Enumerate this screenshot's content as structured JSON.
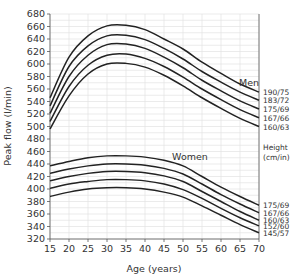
{
  "chart_data": {
    "type": "line",
    "title": "",
    "xlabel": "Age (years)",
    "ylabel": "Peak flow (l/min)",
    "xlim": [
      15,
      70
    ],
    "ylim": [
      320,
      680
    ],
    "x_ticks": [
      15,
      20,
      25,
      30,
      35,
      40,
      45,
      50,
      55,
      60,
      65,
      70
    ],
    "y_ticks": [
      320,
      340,
      360,
      380,
      400,
      420,
      440,
      460,
      480,
      500,
      520,
      540,
      560,
      580,
      600,
      620,
      640,
      660,
      680
    ],
    "grid": true,
    "x": [
      15,
      20,
      25,
      30,
      35,
      40,
      45,
      50,
      55,
      60,
      65,
      70
    ],
    "groups": [
      {
        "name": "Men",
        "series": [
          {
            "name": "190/75",
            "values": [
              546,
              611,
              645,
              661,
              662,
              655,
              640,
              624,
              603,
              585,
              568,
              555
            ]
          },
          {
            "name": "183/72",
            "values": [
              533,
              596,
              629,
              645,
              646,
              639,
              625,
              608,
              588,
              571,
              555,
              542
            ]
          },
          {
            "name": "175/69",
            "values": [
              521,
              580,
              614,
              631,
              632,
              625,
              611,
              594,
              574,
              557,
              541,
              528
            ]
          },
          {
            "name": "167/66",
            "values": [
              508,
              564,
              598,
              614,
              616,
              609,
              596,
              579,
              560,
              543,
              527,
              514
            ]
          },
          {
            "name": "160/63",
            "values": [
              496,
              549,
              584,
              600,
              601,
              595,
              582,
              565,
              546,
              529,
              513,
              500
            ]
          }
        ]
      },
      {
        "name": "Women",
        "series": [
          {
            "name": "175/69",
            "values": [
              437,
              444,
              450,
              453,
              453,
              451,
              446,
              437,
              420,
              403,
              388,
              374
            ]
          },
          {
            "name": "167/66",
            "values": [
              425,
              432,
              437,
              440,
              440,
              438,
              433,
              424,
              408,
              391,
              376,
              362
            ]
          },
          {
            "name": "160/63",
            "values": [
              413,
              420,
              425,
              428,
              428,
              426,
              421,
              412,
              396,
              380,
              364,
              350
            ]
          },
          {
            "name": "152/60",
            "values": [
              401,
              408,
              412,
              415,
              415,
              413,
              408,
              399,
              385,
              369,
              354,
              341
            ]
          },
          {
            "name": "145/57",
            "values": [
              388,
              395,
              400,
              402,
              402,
              400,
              395,
              387,
              373,
              358,
              343,
              330
            ]
          }
        ]
      }
    ],
    "annotations": [
      "Men",
      "Women",
      "Height (cm/in)"
    ]
  },
  "labels": {
    "men": "Men",
    "women": "Women",
    "height_line1": "Height",
    "height_line2": "(cm/in)",
    "xlabel": "Age (years)",
    "ylabel": "Peak flow (l/min)"
  }
}
